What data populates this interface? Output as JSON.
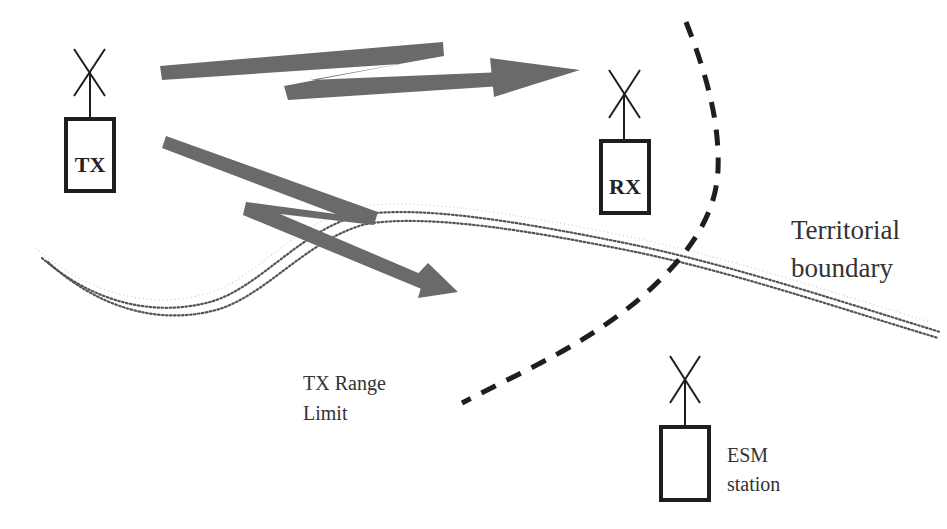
{
  "diagram": {
    "type": "radio-link-interception-scenario",
    "colors": {
      "arrow": "#6a6a6a",
      "outline": "#1e1e1e",
      "dashed_limit": "#1e1e1e",
      "boundary_dots": "#555555",
      "text": "#333333",
      "background": "#ffffff"
    },
    "nodes": {
      "tx": {
        "label": "TX",
        "role": "transmitter"
      },
      "rx": {
        "label": "RX",
        "role": "receiver"
      },
      "esm": {
        "label": "",
        "role": "ESM station"
      }
    },
    "annotations": {
      "territorial_boundary": {
        "line1": "Territorial",
        "line2": "boundary"
      },
      "tx_range_limit": {
        "line1": "TX Range",
        "line2": "Limit"
      },
      "esm_station": {
        "line1": "ESM",
        "line2": "station"
      }
    },
    "links": [
      {
        "from": "TX",
        "to": "RX",
        "style": "lightning-arrow",
        "label": ""
      },
      {
        "from": "TX",
        "to": "across territorial boundary",
        "style": "lightning-arrow",
        "label": ""
      }
    ],
    "lines": [
      {
        "name": "tx-range-limit",
        "style": "dashed"
      },
      {
        "name": "territorial-boundary",
        "style": "double-dotted"
      }
    ]
  }
}
